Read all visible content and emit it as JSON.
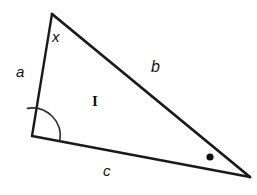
{
  "figure": {
    "background_color": "#ffffff",
    "stroke_color": "#1a1a1a",
    "width": 257,
    "height": 195
  },
  "labels": {
    "angle_x": "x",
    "side_a": "a",
    "side_b": "b",
    "side_c": "c",
    "region_I": "I"
  },
  "geometry": {
    "vertices": {
      "apex": {
        "x": 52,
        "y": 14
      },
      "bottom_left": {
        "x": 32,
        "y": 136
      },
      "right": {
        "x": 250,
        "y": 177
      }
    },
    "sides": [
      {
        "name": "a",
        "from": "apex",
        "to": "bottom_left",
        "stroke_width": 2.4
      },
      {
        "name": "b",
        "from": "apex",
        "to": "right",
        "stroke_width": 2.8
      },
      {
        "name": "c",
        "from": "bottom_left",
        "to": "right",
        "stroke_width": 2.4
      }
    ],
    "angle_arc": {
      "at_vertex": "bottom_left",
      "radius": 28,
      "stroke_color": "#2b2b2b"
    },
    "angle_dot": {
      "near_vertex": "right",
      "x": 210,
      "y": 157,
      "radius": 3.6,
      "fill": "#111111"
    }
  }
}
